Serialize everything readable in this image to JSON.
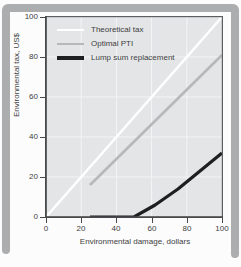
{
  "figure": {
    "kind": "scanned-book-figure",
    "x_axis_title": "Environmental damage, dollars",
    "y_axis_title": "Environmental tax, US$"
  },
  "colors": {
    "frame": "#abadaf",
    "card": "#fcfcfd",
    "plot_background": "#e4e5e7",
    "gridline": "#f4f4f6",
    "axis": "#47494b",
    "plot_border": "#5c5f61",
    "text": "#3c3e40",
    "theoretical_tax_line": "#ffffff",
    "optimal_pti_line": "#b7b8ba",
    "lump_sum_line": "#1e1f20"
  },
  "chart_data": {
    "type": "line",
    "title": "",
    "xlabel": "Environmental damage, dollars",
    "ylabel": "Environmental tax, US$",
    "xlim": [
      0,
      100
    ],
    "ylim": [
      0,
      100
    ],
    "x_ticks": [
      0,
      20,
      40,
      60,
      80,
      100
    ],
    "y_ticks_top_to_bottom": [
      100,
      80,
      60,
      40,
      20,
      0
    ],
    "grid": true,
    "legend_position": "top-left",
    "series": [
      {
        "name": "Theoretical tax",
        "color": "#ffffff",
        "width": 2.6,
        "points": [
          [
            0,
            0
          ],
          [
            100,
            100
          ]
        ]
      },
      {
        "name": "Optimal PTI",
        "color": "#b7b8ba",
        "width": 2.6,
        "points": [
          [
            25,
            16
          ],
          [
            100,
            81
          ]
        ]
      },
      {
        "name": "Lump sum replacement",
        "color": "#1e1f20",
        "width": 3.2,
        "points": [
          [
            25,
            0
          ],
          [
            50,
            0
          ],
          [
            62,
            6
          ],
          [
            75,
            14
          ],
          [
            100,
            32
          ]
        ]
      }
    ]
  }
}
